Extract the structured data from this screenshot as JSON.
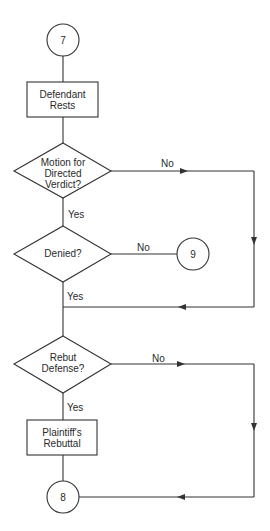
{
  "nodes": {
    "start": {
      "type": "connector",
      "label": "7"
    },
    "defendant_rests": {
      "type": "process",
      "line1": "Defendant",
      "line2": "Rests"
    },
    "motion_directed_verdict": {
      "type": "decision",
      "line1": "Motion for",
      "line2": "Directed",
      "line3": "Verdict?"
    },
    "denied": {
      "type": "decision",
      "line1": "Denied?"
    },
    "connector_9": {
      "type": "connector",
      "label": "9"
    },
    "rebut_defense": {
      "type": "decision",
      "line1": "Rebut",
      "line2": "Defense?"
    },
    "plaintiffs_rebuttal": {
      "type": "process",
      "line1": "Plaintiff's",
      "line2": "Rebuttal"
    },
    "end": {
      "type": "connector",
      "label": "8"
    }
  },
  "edges": {
    "motion_no": "No",
    "motion_yes": "Yes",
    "denied_no": "No",
    "denied_yes": "Yes",
    "rebut_no": "No",
    "rebut_yes": "Yes"
  },
  "colors": {
    "stroke": "#333333",
    "text": "#2a2a2a",
    "background": "#ffffff"
  }
}
